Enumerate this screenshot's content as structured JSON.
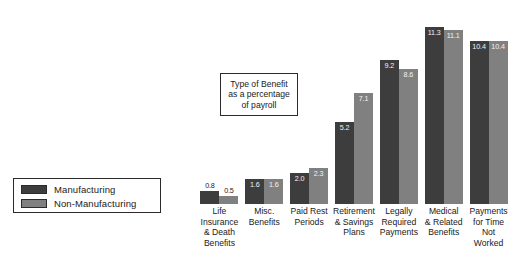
{
  "title_box": {
    "lines": [
      "Type of Benefit",
      "as a percentage",
      "of payroll"
    ]
  },
  "legend": {
    "items": [
      {
        "label": "Manufacturing",
        "color": "#3d3d3d"
      },
      {
        "label": "Non-Manufacturing",
        "color": "#808080"
      }
    ]
  },
  "chart_data": {
    "type": "bar",
    "title": "Type of Benefit as a percentage of payroll",
    "xlabel": "",
    "ylabel": "Percentage of payroll",
    "ylim": [
      0,
      12.5
    ],
    "grid": false,
    "legend_position": "left",
    "categories": [
      "Life Insurance & Death Benefits",
      "Misc. Benefits",
      "Paid Rest Periods",
      "Retirement & Savings Plans",
      "Legally Required Payments",
      "Medical & Related Benefits",
      "Payments for Time Not Worked"
    ],
    "category_lines": [
      [
        "Life",
        "Insurance",
        "& Death",
        "Benefits"
      ],
      [
        "Misc.",
        "Benefits"
      ],
      [
        "Paid Rest",
        "Periods"
      ],
      [
        "Retirement",
        "& Savings",
        "Plans"
      ],
      [
        "Legally",
        "Required",
        "Payments"
      ],
      [
        "Medical",
        "& Related",
        "Benefits"
      ],
      [
        "Payments",
        "for Time",
        "Not",
        "Worked"
      ]
    ],
    "series": [
      {
        "name": "Manufacturing",
        "color": "#3d3d3d",
        "values": [
          0.8,
          1.6,
          2.0,
          5.2,
          9.2,
          11.3,
          10.4
        ],
        "labels": [
          "0.8",
          "1.6",
          "2.0",
          "5.2",
          "9.2",
          "11.3",
          "10.4"
        ]
      },
      {
        "name": "Non-Manufacturing",
        "color": "#808080",
        "values": [
          0.5,
          1.6,
          2.3,
          7.1,
          8.6,
          11.1,
          10.4
        ],
        "labels": [
          "0.5",
          "1.6",
          "2.3",
          "7.1",
          "8.6",
          "11.1",
          "10.4"
        ]
      }
    ]
  }
}
